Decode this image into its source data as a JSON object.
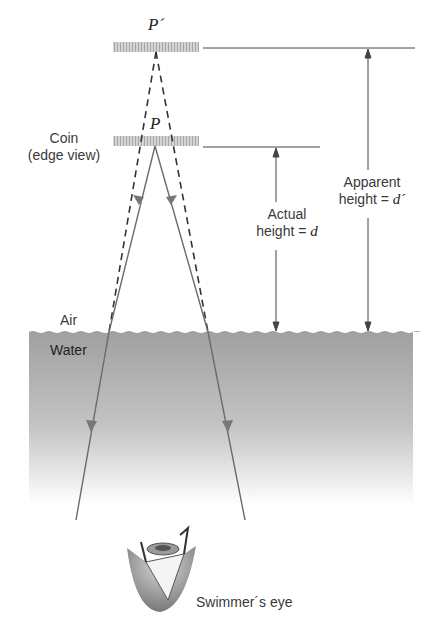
{
  "diagram": {
    "labels": {
      "image_point": "P´",
      "object_point": "P",
      "coin_line1": "Coin",
      "coin_line2": "(edge view)",
      "actual_line1": "Actual",
      "actual_line2_prefix": "height = ",
      "actual_var": "d",
      "apparent_line1": "Apparent",
      "apparent_line2_prefix": "height = ",
      "apparent_var": "d´",
      "air": "Air",
      "water": "Water",
      "eye": "Swimmer´s eye"
    },
    "colors": {
      "water_top": "#9e9e9e",
      "water_bottom": "#ffffff",
      "ray": "#6b6b6b",
      "dashed": "#333333",
      "coin": "#c8c8c8",
      "dimension_line": "#444444"
    },
    "elements": {
      "coin_image_y": 47,
      "coin_actual_y": 141,
      "water_surface_y": 330,
      "actual_height_arrow_x": 276,
      "apparent_height_arrow_x": 368
    }
  }
}
